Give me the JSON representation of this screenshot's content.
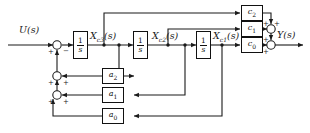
{
  "diagram": {
    "colors": {
      "line": "#1a1a1a",
      "block_border": "#111111",
      "background": "#ffffff"
    },
    "signals": {
      "input": "U(s)",
      "output": "Y(s)",
      "state3": "X",
      "state3_sub": "c3",
      "state3_paren": "(s)",
      "state2": "X",
      "state2_sub": "c2",
      "state2_paren": "(s)",
      "state1": "X",
      "state1_sub": "c1",
      "state1_paren": "(s)"
    },
    "integrators": [
      {
        "id": "integrator-1",
        "numerator": "1",
        "denominator": "s"
      },
      {
        "id": "integrator-2",
        "numerator": "1",
        "denominator": "s"
      },
      {
        "id": "integrator-3",
        "numerator": "1",
        "denominator": "s"
      }
    ],
    "feedback_gains": [
      {
        "id": "gain-a2",
        "symbol": "a",
        "subscript": "2"
      },
      {
        "id": "gain-a1",
        "symbol": "a",
        "subscript": "1"
      },
      {
        "id": "gain-a0",
        "symbol": "a",
        "subscript": "0"
      }
    ],
    "feedforward_gains": [
      {
        "id": "gain-c2",
        "symbol": "c",
        "subscript": "2"
      },
      {
        "id": "gain-c1",
        "symbol": "c",
        "subscript": "1"
      },
      {
        "id": "gain-c0",
        "symbol": "c",
        "subscript": "0"
      }
    ],
    "summing_junctions": [
      {
        "id": "sum-input",
        "signs": [
          "+",
          "-"
        ]
      },
      {
        "id": "sum-a2",
        "signs": [
          "+",
          "+"
        ]
      },
      {
        "id": "sum-a1",
        "signs": [
          "+",
          "+"
        ]
      },
      {
        "id": "sum-out-upper",
        "signs": [
          "+",
          "+"
        ]
      },
      {
        "id": "sum-out-lower",
        "signs": [
          "+",
          "+"
        ]
      }
    ],
    "signs": {
      "plus": "+",
      "minus": "−"
    }
  }
}
